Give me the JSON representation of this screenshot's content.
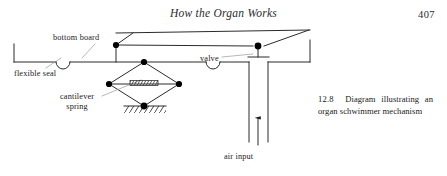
{
  "page": {
    "running_head": "How the Organ Works",
    "folio": "407"
  },
  "figure": {
    "caption_number": "12.8",
    "caption_text": "Diagram illustrating an organ schwimmer mechanism",
    "labels": {
      "bottom_board": "bottom board",
      "flexible_seal": "flexible seal",
      "cantilever_spring_line1": "cantilever",
      "cantilever_spring_line2": "spring",
      "valve": "valve",
      "air_input": "air input"
    },
    "colors": {
      "ink": "#1a1a1a",
      "line": "#2b2b2b",
      "paper": "#ffffff",
      "node_fill": "#000000"
    }
  }
}
